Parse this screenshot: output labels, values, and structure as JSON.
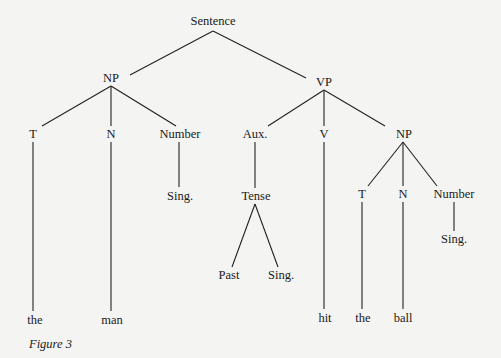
{
  "figure": {
    "caption": "Figure 3",
    "type": "phrase-structure tree"
  },
  "nodes": {
    "sentence": {
      "label": "Sentence",
      "x": 213,
      "y": 25
    },
    "np1": {
      "label": "NP",
      "x": 111,
      "y": 82
    },
    "vp": {
      "label": "VP",
      "x": 324,
      "y": 86
    },
    "t1": {
      "label": "T",
      "x": 33,
      "y": 138
    },
    "n1": {
      "label": "N",
      "x": 111,
      "y": 138
    },
    "number1": {
      "label": "Number",
      "x": 180,
      "y": 138
    },
    "sing1": {
      "label": "Sing.",
      "x": 180,
      "y": 200
    },
    "aux": {
      "label": "Aux.",
      "x": 255,
      "y": 138
    },
    "v": {
      "label": "V",
      "x": 324,
      "y": 138
    },
    "np2": {
      "label": "NP",
      "x": 404,
      "y": 138
    },
    "tense": {
      "label": "Tense",
      "x": 256,
      "y": 200
    },
    "past": {
      "label": "Past",
      "x": 229,
      "y": 279
    },
    "sing2": {
      "label": "Sing.",
      "x": 281,
      "y": 279
    },
    "t2": {
      "label": "T",
      "x": 362,
      "y": 198
    },
    "n2": {
      "label": "N",
      "x": 403,
      "y": 198
    },
    "number2": {
      "label": "Number",
      "x": 454,
      "y": 198
    },
    "sing3": {
      "label": "Sing.",
      "x": 454,
      "y": 243
    },
    "the1": {
      "label": "the",
      "x": 35,
      "y": 324
    },
    "man": {
      "label": "man",
      "x": 112,
      "y": 324
    },
    "hit": {
      "label": "hit",
      "x": 325,
      "y": 322
    },
    "the2": {
      "label": "the",
      "x": 363,
      "y": 322
    },
    "ball": {
      "label": "ball",
      "x": 403,
      "y": 322
    }
  },
  "edges": [
    [
      "sentence",
      "np1"
    ],
    [
      "sentence",
      "vp"
    ],
    [
      "np1",
      "t1"
    ],
    [
      "np1",
      "n1"
    ],
    [
      "np1",
      "number1"
    ],
    [
      "number1",
      "sing1"
    ],
    [
      "t1",
      "the1"
    ],
    [
      "n1",
      "man"
    ],
    [
      "vp",
      "aux"
    ],
    [
      "vp",
      "v"
    ],
    [
      "vp",
      "np2"
    ],
    [
      "aux",
      "tense"
    ],
    [
      "tense",
      "past"
    ],
    [
      "tense",
      "sing2"
    ],
    [
      "v",
      "hit"
    ],
    [
      "np2",
      "t2"
    ],
    [
      "np2",
      "n2"
    ],
    [
      "np2",
      "number2"
    ],
    [
      "number2",
      "sing3"
    ],
    [
      "t2",
      "the2"
    ],
    [
      "n2",
      "ball"
    ]
  ]
}
